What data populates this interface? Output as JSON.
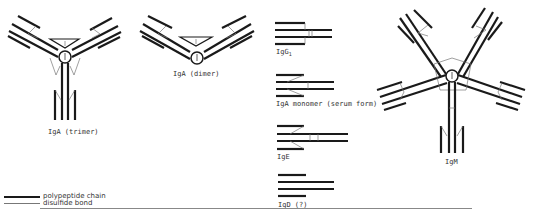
{
  "figure": {
    "structures": [
      {
        "id": "iga-trimer",
        "label": "IgA (trimer)",
        "arms": 3,
        "has_j_chain": true,
        "has_secretory_component": true
      },
      {
        "id": "iga-dimer",
        "label": "IgA (dimer)",
        "arms": 2,
        "has_j_chain": true,
        "has_secretory_component": true
      },
      {
        "id": "igg1",
        "label": "IgG",
        "subscript": "1"
      },
      {
        "id": "iga-monomer",
        "label": "IgA monomer (serum form)"
      },
      {
        "id": "ige",
        "label": "IgE"
      },
      {
        "id": "igd",
        "label": "IgD (?)"
      },
      {
        "id": "igm",
        "label": "IgM",
        "arms": 5,
        "has_j_chain": true
      }
    ],
    "j_chain_label": "J",
    "legend": [
      {
        "style": "thick",
        "label": "polypeptide chain"
      },
      {
        "style": "thin",
        "label": "disulfide bond"
      }
    ]
  }
}
